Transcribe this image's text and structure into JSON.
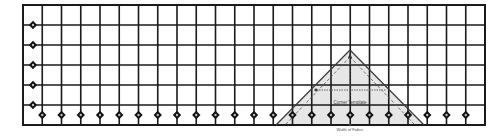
{
  "diagram": {
    "grid": {
      "left": 23,
      "top": 5,
      "right": 485,
      "bottom": 125,
      "columns": 24,
      "rows": 6,
      "line_color": "#1a1a1a",
      "border_width": 2,
      "line_width": 1.6
    },
    "markers": {
      "color": "#111111",
      "left_column": {
        "x": 33,
        "ys": [
          25,
          45,
          65,
          85,
          105
        ]
      },
      "bottom_row": {
        "y": 115
      }
    },
    "template": {
      "label": "Corner Template",
      "bottom_label": "Width of Fabric",
      "fill": "#e6e6e6",
      "edge_color": "#3a3a3a",
      "apex": [
        350,
        50
      ],
      "base_left": [
        276,
        125
      ],
      "base_right": [
        424,
        125
      ]
    }
  }
}
